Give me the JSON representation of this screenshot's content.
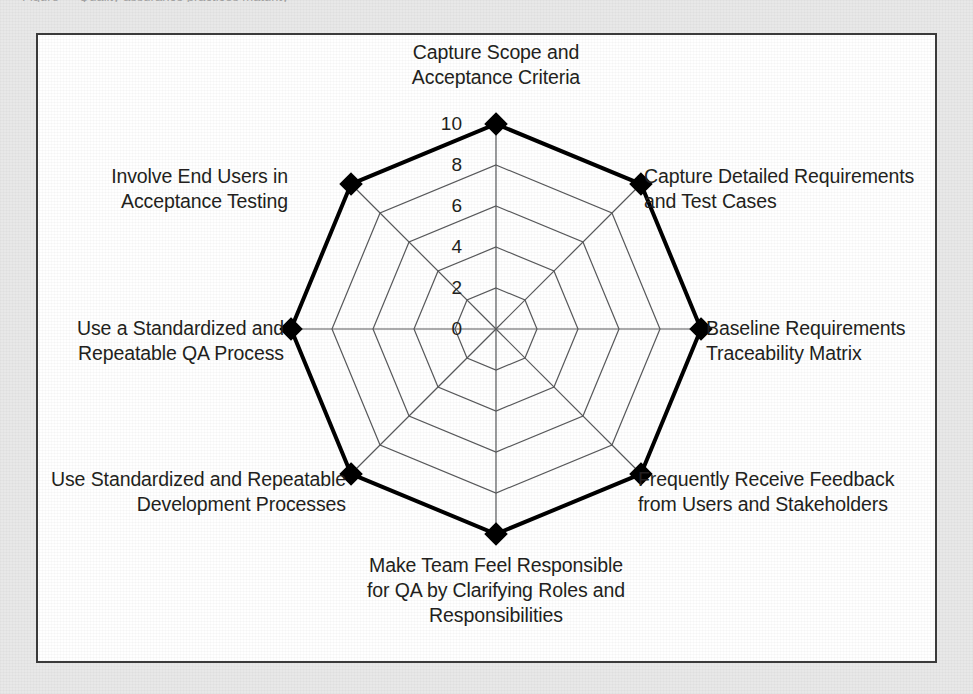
{
  "page": {
    "background_color": "#e8e8e8",
    "frame_background": "#ffffff",
    "frame_border_color": "#3b3b3b",
    "caption_sliver": "Figure — Quality assurance practices maturity"
  },
  "chart_data": {
    "type": "radar",
    "title": "",
    "subtitle": "",
    "xlabel": "",
    "ylabel": "",
    "grid": true,
    "legend_position": "none",
    "rlim": [
      0,
      10
    ],
    "tick_labels": [
      "0",
      "2",
      "4",
      "6",
      "8",
      "10"
    ],
    "tick_values": [
      0,
      2,
      4,
      6,
      8,
      10
    ],
    "rings": 5,
    "categories": [
      "Capture Scope and\nAcceptance Criteria",
      "Capture Detailed Requirements\nand Test Cases",
      "Baseline Requirements\nTraceability Matrix",
      "Frequently Receive Feedback\nfrom Users and Stakeholders",
      "Make Team Feel Responsible\nfor QA by Clarifying Roles and\nResponsibilities",
      "Use Standardized and Repeatable\nDevelopment Processes",
      "Use a Standardized and\nRepeatable QA Process",
      "Involve End Users in\nAcceptance Testing"
    ],
    "series": [
      {
        "name": "Assessment",
        "values": [
          10,
          10,
          10,
          10,
          10,
          10,
          10,
          10
        ],
        "line_color": "#000000",
        "line_width": 4,
        "marker": "diamond",
        "marker_color": "#000000",
        "fill": "none"
      }
    ],
    "grid_color": "#58595b",
    "axis_color": "#58595b"
  },
  "geometry": {
    "center_x": 458,
    "center_y": 294,
    "radius_max": 205,
    "start_angle_deg": -90,
    "axis_count": 8
  },
  "axis_label_positions": [
    {
      "name": "capture-scope",
      "left": 332,
      "top": 5,
      "width": 252,
      "align": "al-center"
    },
    {
      "name": "capture-detailed-requirements",
      "left": 606,
      "top": 129,
      "width": 300,
      "align": "al-left"
    },
    {
      "name": "baseline-rtm",
      "left": 668,
      "top": 281,
      "width": 240,
      "align": "al-left"
    },
    {
      "name": "frequently-receive-feedback",
      "left": 600,
      "top": 432,
      "width": 300,
      "align": "al-left"
    },
    {
      "name": "make-team-feel-responsible",
      "left": 318,
      "top": 518,
      "width": 280,
      "align": "al-center"
    },
    {
      "name": "use-standardized-development",
      "left": 8,
      "top": 432,
      "width": 300,
      "align": "al-right"
    },
    {
      "name": "use-standardized-qa",
      "left": 16,
      "top": 281,
      "width": 230,
      "align": "al-right"
    },
    {
      "name": "involve-end-users",
      "left": 50,
      "top": 129,
      "width": 200,
      "align": "al-right"
    }
  ],
  "tick_label_positions": [
    {
      "value": "10",
      "left": 382,
      "top": 79
    },
    {
      "value": "8",
      "left": 382,
      "top": 120
    },
    {
      "value": "6",
      "left": 382,
      "top": 161
    },
    {
      "value": "4",
      "left": 382,
      "top": 202
    },
    {
      "value": "2",
      "left": 382,
      "top": 243
    },
    {
      "value": "0",
      "left": 382,
      "top": 284
    }
  ]
}
